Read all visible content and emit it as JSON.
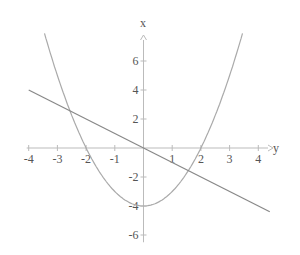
{
  "chart_data": {
    "type": "line",
    "title": "",
    "xlabel": "y",
    "ylabel": "x",
    "xlim": [
      -4,
      4.5
    ],
    "ylim": [
      -6.5,
      7.5
    ],
    "x_ticks": [
      -4,
      -3,
      -2,
      -1,
      1,
      2,
      3,
      4
    ],
    "x_tick_labels": [
      "-4",
      "-3",
      "-2",
      "-1",
      "1",
      "2",
      "3",
      "4"
    ],
    "y_ticks": [
      6,
      4,
      2,
      -2,
      -4,
      -6
    ],
    "y_tick_labels": [
      "6",
      "4",
      "2",
      "-2",
      "-4",
      "-6"
    ],
    "grid": false,
    "legend": null,
    "series": [
      {
        "name": "parabola",
        "expression": "x^2 - 4",
        "x": [
          -3.45,
          -3,
          -2.5,
          -2,
          -1.5,
          -1,
          -0.5,
          0,
          0.5,
          1,
          1.5,
          2,
          2.5,
          3,
          3.45
        ],
        "values": [
          7.9,
          5,
          2.25,
          0,
          -1.75,
          -3,
          -3.75,
          -4,
          -3.75,
          -3,
          -1.75,
          0,
          2.25,
          5,
          7.9
        ],
        "color": "#aaaaaa"
      },
      {
        "name": "line",
        "expression": "-x",
        "x": [
          -4,
          4.4
        ],
        "values": [
          4,
          -4.4
        ],
        "color": "#888888"
      }
    ],
    "colors": {
      "axis": "#bbbbbb",
      "text": "#555555"
    }
  }
}
